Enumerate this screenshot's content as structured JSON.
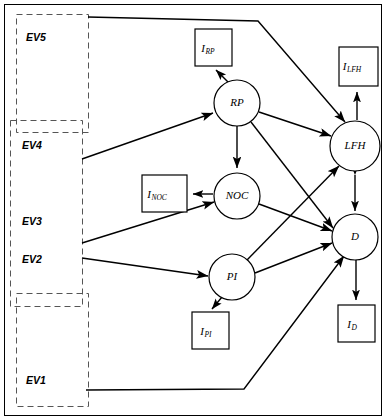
{
  "diagram": {
    "type": "path-diagram",
    "exogenous_boxes": [
      {
        "id": "EV5",
        "label": "EV5",
        "x": 16,
        "y": 14,
        "w": 72,
        "h": 118,
        "label_x": 26,
        "label_y": 38
      },
      {
        "id": "EV4",
        "label": "EV4",
        "x": 10,
        "y": 120,
        "w": 72,
        "h": 186,
        "label_x": 22,
        "label_y": 146
      },
      {
        "id": "EV3",
        "label": "EV3",
        "x": 10,
        "y": 120,
        "w": 72,
        "h": 186,
        "label_x": 22,
        "label_y": 222
      },
      {
        "id": "EV2",
        "label": "EV2",
        "x": 10,
        "y": 120,
        "w": 72,
        "h": 186,
        "label_x": 22,
        "label_y": 260
      },
      {
        "id": "EV1",
        "label": "EV1",
        "x": 16,
        "y": 293,
        "w": 72,
        "h": 113,
        "label_x": 26,
        "label_y": 381
      }
    ],
    "latent_nodes": [
      {
        "id": "RP",
        "label": "RP",
        "cx": 237,
        "cy": 103,
        "r": 23
      },
      {
        "id": "NOC",
        "label": "NOC",
        "cx": 237,
        "cy": 196,
        "r": 23
      },
      {
        "id": "PI",
        "label": "PI",
        "cx": 232,
        "cy": 277,
        "r": 23
      },
      {
        "id": "LFH",
        "label": "LFH",
        "cx": 355,
        "cy": 146,
        "r": 25
      },
      {
        "id": "D",
        "label": "D",
        "cx": 355,
        "cy": 237,
        "r": 23
      }
    ],
    "indicator_boxes": [
      {
        "id": "I_RP",
        "main": "I",
        "sub": "RP",
        "x": 195,
        "y": 29,
        "w": 37,
        "h": 37
      },
      {
        "id": "I_NOC",
        "main": "I",
        "sub": "NOC",
        "x": 142,
        "y": 175,
        "w": 45,
        "h": 37
      },
      {
        "id": "I_PI",
        "main": "I",
        "sub": "PI",
        "x": 192,
        "y": 312,
        "w": 37,
        "h": 37
      },
      {
        "id": "I_LFH",
        "main": "I",
        "sub": "LFH",
        "x": 339,
        "y": 47,
        "w": 39,
        "h": 39
      },
      {
        "id": "I_D",
        "main": "I",
        "sub": "D",
        "x": 338,
        "y": 305,
        "w": 37,
        "h": 37
      }
    ],
    "edges": [
      {
        "from": "EV5",
        "to": "LFH",
        "kind": "exogenous"
      },
      {
        "from": "EV4",
        "to": "RP",
        "kind": "exogenous"
      },
      {
        "from": "EV3",
        "to": "NOC",
        "kind": "exogenous"
      },
      {
        "from": "EV2",
        "to": "PI",
        "kind": "exogenous"
      },
      {
        "from": "EV1",
        "to": "D",
        "kind": "exogenous"
      },
      {
        "from": "RP",
        "to": "I_RP",
        "kind": "measurement"
      },
      {
        "from": "RP",
        "to": "NOC",
        "kind": "structural"
      },
      {
        "from": "RP",
        "to": "LFH",
        "kind": "structural"
      },
      {
        "from": "RP",
        "to": "D",
        "kind": "structural"
      },
      {
        "from": "NOC",
        "to": "I_NOC",
        "kind": "measurement"
      },
      {
        "from": "NOC",
        "to": "D",
        "kind": "structural"
      },
      {
        "from": "PI",
        "to": "I_PI",
        "kind": "measurement"
      },
      {
        "from": "PI",
        "to": "LFH",
        "kind": "structural"
      },
      {
        "from": "PI",
        "to": "D",
        "kind": "structural"
      },
      {
        "from": "LFH",
        "to": "I_LFH",
        "kind": "measurement"
      },
      {
        "from": "LFH",
        "to": "D",
        "kind": "bidirectional"
      },
      {
        "from": "D",
        "to": "I_D",
        "kind": "measurement"
      }
    ],
    "outer_frame": {
      "x": 4,
      "y": 4,
      "w": 378,
      "h": 412
    }
  }
}
